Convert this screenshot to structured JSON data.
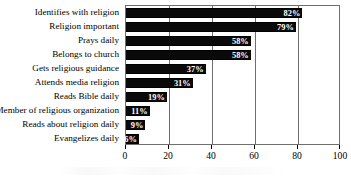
{
  "chart_data": {
    "type": "bar",
    "orientation": "horizontal",
    "title": "",
    "xlabel": "",
    "ylabel": "",
    "xlim": [
      0,
      100
    ],
    "xticks": [
      0,
      20,
      40,
      60,
      80,
      100
    ],
    "xtick_labels": [
      "0",
      "20",
      "40",
      "60",
      "80",
      "100"
    ],
    "grid": true,
    "legend": false,
    "value_suffix": "%",
    "bar_color": "#0a0a0a",
    "value_label_color": "#ffffff",
    "frame_color": "#6f6f6f",
    "categories": [
      "Identifies with religion",
      "Religion important",
      "Prays daily",
      "Belongs to church",
      "Gets religious guidance",
      "Attends media religion",
      "Reads Bible daily",
      "Member of religious organization",
      "Reads about religion daily",
      "Evangelizes daily"
    ],
    "values": [
      82,
      79,
      58,
      58,
      37,
      31,
      19,
      11,
      9,
      6
    ],
    "data_labels": [
      "82%",
      "79%",
      "58%",
      "58%",
      "37%",
      "31%",
      "19%",
      "11%",
      "9%",
      "6%"
    ]
  }
}
